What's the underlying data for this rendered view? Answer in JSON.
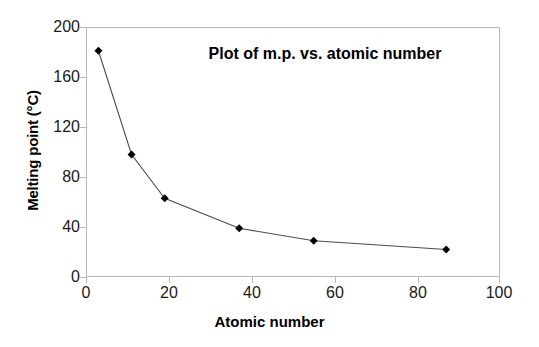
{
  "chart_data": {
    "type": "line",
    "title": "Plot of m.p. vs. atomic number",
    "xlabel": "Atomic number",
    "ylabel": "Melting point (°C)",
    "xlim": [
      0,
      100
    ],
    "ylim": [
      0,
      200
    ],
    "xticks": [
      0,
      20,
      40,
      60,
      80,
      100
    ],
    "yticks": [
      0,
      40,
      80,
      120,
      160,
      200
    ],
    "grid": false,
    "legend": "none",
    "marker": "diamond",
    "marker_color": "#000000",
    "line_color": "#4d4d4d",
    "x": [
      3,
      11,
      19,
      37,
      55,
      87
    ],
    "values": [
      181,
      98,
      63,
      39,
      29,
      22
    ],
    "series": [
      {
        "name": "melting point",
        "points": [
          {
            "x": 3,
            "y": 181
          },
          {
            "x": 11,
            "y": 98
          },
          {
            "x": 19,
            "y": 63
          },
          {
            "x": 37,
            "y": 39
          },
          {
            "x": 55,
            "y": 29
          },
          {
            "x": 87,
            "y": 22
          }
        ]
      }
    ]
  },
  "axes": {
    "y_tick_labels": [
      "200",
      "160",
      "120",
      "80",
      "40",
      "0"
    ],
    "x_tick_labels": [
      "0",
      "20",
      "40",
      "60",
      "80",
      "100"
    ]
  }
}
